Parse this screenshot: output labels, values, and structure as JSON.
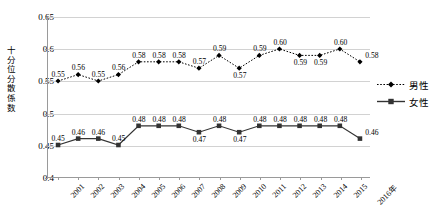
{
  "chart_data": {
    "type": "line",
    "title": "",
    "xlabel": "",
    "ylabel": "十分位分散係数",
    "ylim": [
      0.4,
      0.65
    ],
    "ytick_step": 0.05,
    "yticks": [
      "0.4",
      "0.45",
      "0.5",
      "0.55",
      "0.6",
      "0.65"
    ],
    "ytick_values": [
      0.4,
      0.45,
      0.5,
      0.55,
      0.6,
      0.65
    ],
    "grid": true,
    "legend_position": "right",
    "categories": [
      "2001",
      "2002",
      "2003",
      "2004",
      "2005",
      "2006",
      "2007",
      "2008",
      "2009",
      "2010",
      "2011",
      "2012",
      "2013",
      "2014",
      "2015",
      "2016年"
    ],
    "series": [
      {
        "name": "男性",
        "marker": "diamond",
        "linestyle": "dotted",
        "color": "#000000",
        "values": [
          0.55,
          0.56,
          0.55,
          0.56,
          0.58,
          0.58,
          0.58,
          0.57,
          0.59,
          0.57,
          0.59,
          0.6,
          0.59,
          0.59,
          0.6,
          0.58
        ],
        "labels": [
          "0.55",
          "0.56",
          "0.55",
          "0.56",
          "0.58",
          "0.58",
          "0.58",
          "0.57",
          "0.59",
          "0.57",
          "0.59",
          "0.60",
          "0.59",
          "0.59",
          "0.60",
          "0.58"
        ],
        "label_placement": [
          "above",
          "above",
          "above",
          "above",
          "above",
          "above",
          "above",
          "above",
          "above",
          "below",
          "above",
          "above",
          "below",
          "below",
          "above",
          "right"
        ]
      },
      {
        "name": "女性",
        "marker": "square",
        "linestyle": "solid",
        "color": "#333333",
        "values": [
          0.45,
          0.46,
          0.46,
          0.45,
          0.48,
          0.48,
          0.48,
          0.47,
          0.48,
          0.47,
          0.48,
          0.48,
          0.48,
          0.48,
          0.48,
          0.46
        ],
        "labels": [
          "0.45",
          "0.46",
          "0.46",
          "0.45",
          "0.48",
          "0.48",
          "0.48",
          "0.47",
          "0.48",
          "0.47",
          "0.48",
          "0.48",
          "0.48",
          "0.48",
          "0.48",
          "0.46"
        ],
        "label_placement": [
          "above",
          "above",
          "above",
          "above",
          "above",
          "above",
          "above",
          "below",
          "above",
          "below",
          "above",
          "above",
          "above",
          "above",
          "above",
          "right"
        ]
      }
    ]
  },
  "legend": {
    "items": [
      {
        "label": "男性"
      },
      {
        "label": "女性"
      }
    ]
  },
  "axis_title": {
    "y_chars": [
      "十",
      "分",
      "位",
      "分",
      "散",
      "係",
      "数"
    ]
  },
  "colors": {
    "axis": "#9a9a9a",
    "grid": "#d2d2d2",
    "male": "#000000",
    "female": "#333333",
    "background": "#ffffff"
  }
}
